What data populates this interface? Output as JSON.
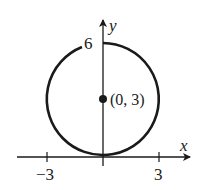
{
  "diagram": {
    "type": "circle-on-axes",
    "colors": {
      "stroke": "#1a1a1a",
      "background": "#ffffff"
    },
    "axes": {
      "x_label": "x",
      "y_label": "y",
      "x_ticks": [
        {
          "value": -3,
          "label": "−3"
        },
        {
          "value": 3,
          "label": "3"
        }
      ],
      "y_tick_label": "6"
    },
    "circle": {
      "center": [
        0,
        3
      ],
      "radius": 3
    },
    "center_point": {
      "label": "(0, 3)"
    }
  }
}
